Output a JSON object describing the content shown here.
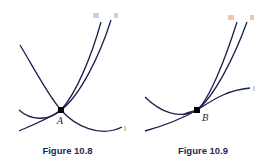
{
  "figures": [
    {
      "caption": "Figure 10.8",
      "point_label": "A",
      "curve_labels": [
        "I",
        "II",
        "III"
      ]
    },
    {
      "caption": "Figure 10.9",
      "point_label": "B",
      "curve_labels": [
        "I",
        "II",
        "III"
      ]
    }
  ],
  "colors": {
    "curve": "#1c1f4d",
    "caption": "#1a2a5a",
    "label": "#777777"
  }
}
